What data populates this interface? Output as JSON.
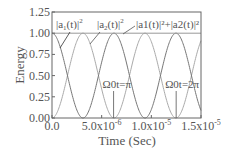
{
  "chart_data": {
    "type": "line",
    "title": "",
    "xlabel": "Time (Sec)",
    "ylabel": "Energy",
    "xlim": [
      0,
      1.5e-05
    ],
    "ylim": [
      0,
      1.25
    ],
    "grid": false,
    "x_ticks": [
      0,
      5e-06,
      1e-05,
      1.5e-05
    ],
    "x_tick_labels": [
      "0.0",
      "5.0x10",
      "1.0x10",
      "1.5x10"
    ],
    "x_tick_exponents": [
      "",
      "-6",
      "-5",
      "-5"
    ],
    "y_ticks": [
      0,
      0.25,
      0.5,
      0.75,
      1.0,
      1.25
    ],
    "y_tick_labels": [
      "0.00",
      "0.25",
      "0.50",
      "0.75",
      "1.00",
      "1.25"
    ],
    "period_cos2": 6.24e-06,
    "series": [
      {
        "name": "|a1(t)|^2",
        "function": "cos^2(Omega0 t/1)",
        "color": "#777777",
        "start_value": 1.0
      },
      {
        "name": "|a2(t)|^2",
        "function": "sin^2(Omega0 t)",
        "color": "#aaaaaa",
        "start_value": 0.0
      },
      {
        "name": "|a1(t)|^2+|a2(t)|^2",
        "function": "constant",
        "color": "#999999",
        "value": 1.0
      }
    ],
    "annotations": [
      {
        "text": "Ω0t=π",
        "x": 6.2e-06,
        "y": 0.0
      },
      {
        "text": "Ω0t=2π",
        "x": 1.25e-05,
        "y": 0.0
      }
    ],
    "legend_labels": {
      "a1": {
        "base": "|a",
        "sub": "1",
        "mid": "(t)|",
        "sup": "2"
      },
      "a2": {
        "base": "|a",
        "sub": "2",
        "mid": "(t)|",
        "sup": "2"
      },
      "sum": "|a1(t)|²+|a2(t)|²"
    }
  }
}
